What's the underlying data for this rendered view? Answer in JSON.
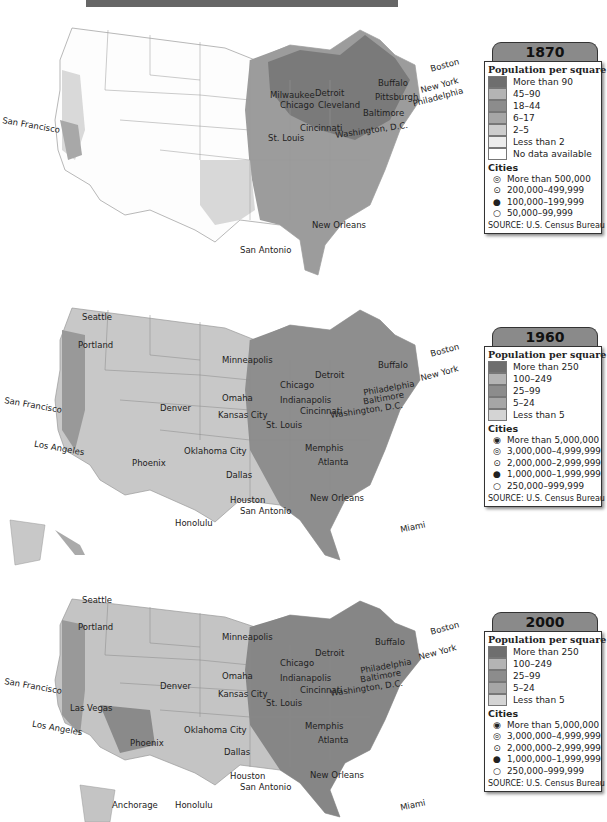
{
  "header": {
    "title_bar": ""
  },
  "maps": [
    {
      "year": "1870",
      "legend": {
        "heading": "Population per square mile",
        "density": [
          {
            "label": "More than 90",
            "color": "#6e6e6e"
          },
          {
            "label": "45–90",
            "color": "#b4b4b4"
          },
          {
            "label": "18–44",
            "color": "#8c8c8c"
          },
          {
            "label": "6–17",
            "color": "#a6a6a6"
          },
          {
            "label": "2–5",
            "color": "#cdcdcd"
          },
          {
            "label": "Less than 2",
            "color": "#ececec"
          },
          {
            "label": "No data available",
            "color": "#ffffff"
          }
        ],
        "cities_heading": "Cities",
        "cities": [
          {
            "symbol": "◎",
            "label": "More than 500,000"
          },
          {
            "symbol": "⊙",
            "label": "200,000–499,999"
          },
          {
            "symbol": "●",
            "label": "100,000–199,999"
          },
          {
            "symbol": "○",
            "label": "50,000–99,999"
          }
        ],
        "source": "SOURCE: U.S. Census Bureau"
      },
      "cities": [
        "San Francisco",
        "Milwaukee",
        "Chicago",
        "Detroit",
        "Cleveland",
        "Buffalo",
        "Pittsburgh",
        "Boston",
        "New York",
        "Philadelphia",
        "Baltimore",
        "Washington, D.C.",
        "Cincinnati",
        "St. Louis",
        "New Orleans",
        "San Antonio"
      ]
    },
    {
      "year": "1960",
      "legend": {
        "heading": "Population per square mile",
        "density": [
          {
            "label": "More than 250",
            "color": "#6e6e6e"
          },
          {
            "label": "100–249",
            "color": "#b4b4b4"
          },
          {
            "label": "25–99",
            "color": "#8c8c8c"
          },
          {
            "label": "5–24",
            "color": "#a6a6a6"
          },
          {
            "label": "Less than 5",
            "color": "#d4d4d4"
          }
        ],
        "cities_heading": "Cities",
        "cities": [
          {
            "symbol": "◉",
            "label": "More than 5,000,000"
          },
          {
            "symbol": "◎",
            "label": "3,000,000–4,999,999"
          },
          {
            "symbol": "⊙",
            "label": "2,000,000–2,999,999"
          },
          {
            "symbol": "●",
            "label": "1,000,000–1,999,999"
          },
          {
            "symbol": "○",
            "label": "250,000–999,999"
          }
        ],
        "source": "SOURCE: U.S. Census Bureau"
      },
      "cities": [
        "Seattle",
        "Portland",
        "San Francisco",
        "Los Angeles",
        "Phoenix",
        "Denver",
        "Minneapolis",
        "Omaha",
        "Kansas City",
        "St. Louis",
        "Oklahoma City",
        "Dallas",
        "Houston",
        "San Antonio",
        "Chicago",
        "Detroit",
        "Indianapolis",
        "Cincinnati",
        "Buffalo",
        "Boston",
        "New York",
        "Philadelphia",
        "Baltimore",
        "Washington, D.C.",
        "Memphis",
        "Atlanta",
        "New Orleans",
        "Miami",
        "Honolulu"
      ]
    },
    {
      "year": "2000",
      "legend": {
        "heading": "Population per square mile",
        "density": [
          {
            "label": "More than 250",
            "color": "#6e6e6e"
          },
          {
            "label": "100–249",
            "color": "#b4b4b4"
          },
          {
            "label": "25–99",
            "color": "#8c8c8c"
          },
          {
            "label": "5–24",
            "color": "#a6a6a6"
          },
          {
            "label": "Less than 5",
            "color": "#d4d4d4"
          }
        ],
        "cities_heading": "Cities",
        "cities": [
          {
            "symbol": "◉",
            "label": "More than 5,000,000"
          },
          {
            "symbol": "◎",
            "label": "3,000,000–4,999,999"
          },
          {
            "symbol": "⊙",
            "label": "2,000,000–2,999,999"
          },
          {
            "symbol": "●",
            "label": "1,000,000–1,999,999"
          },
          {
            "symbol": "○",
            "label": "250,000–999,999"
          }
        ],
        "source": "SOURCE: U.S. Census Bureau"
      },
      "cities": [
        "Seattle",
        "Portland",
        "San Francisco",
        "Las Vegas",
        "Los Angeles",
        "Phoenix",
        "Denver",
        "Minneapolis",
        "Omaha",
        "Kansas City",
        "St. Louis",
        "Oklahoma City",
        "Dallas",
        "Houston",
        "San Antonio",
        "Chicago",
        "Detroit",
        "Indianapolis",
        "Cincinnati",
        "Buffalo",
        "Boston",
        "New York",
        "Philadelphia",
        "Baltimore",
        "Washington, D.C.",
        "Memphis",
        "Atlanta",
        "New Orleans",
        "Miami",
        "Anchorage",
        "Honolulu"
      ]
    }
  ]
}
